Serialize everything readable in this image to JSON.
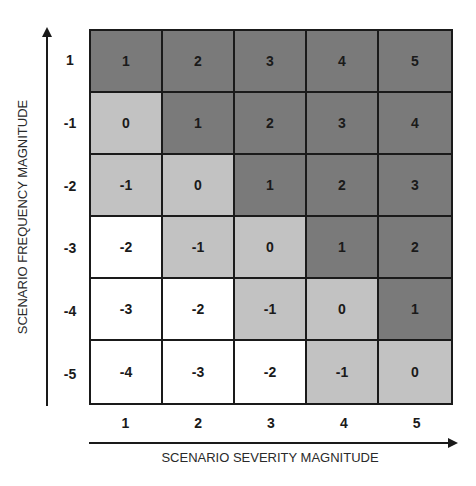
{
  "chart_data": {
    "type": "heatmap",
    "title": "",
    "xlabel": "SCENARIO SEVERITY MAGNITUDE",
    "ylabel": "SCENARIO FREQUENCY MAGNITUDE",
    "x_categories": [
      "1",
      "2",
      "3",
      "4",
      "5"
    ],
    "y_categories": [
      "1",
      "-1",
      "-2",
      "-3",
      "-4",
      "-5"
    ],
    "values": [
      [
        1,
        2,
        3,
        4,
        5
      ],
      [
        0,
        1,
        2,
        3,
        4
      ],
      [
        -1,
        0,
        1,
        2,
        3
      ],
      [
        -2,
        -1,
        0,
        1,
        2
      ],
      [
        -3,
        -2,
        -1,
        0,
        1
      ],
      [
        -4,
        -3,
        -2,
        -1,
        0
      ]
    ],
    "color_scale": {
      "high": "#7a7a7a",
      "medium": "#c2c2c2",
      "low": "#ffffff"
    },
    "color_rule": "value >= 1 -> high; value in [-1, 0] -> medium; value <= -2 -> low",
    "grid": true,
    "legend": "none"
  },
  "axes": {
    "x_title": "SCENARIO SEVERITY MAGNITUDE",
    "y_title": "SCENARIO FREQUENCY MAGNITUDE"
  }
}
